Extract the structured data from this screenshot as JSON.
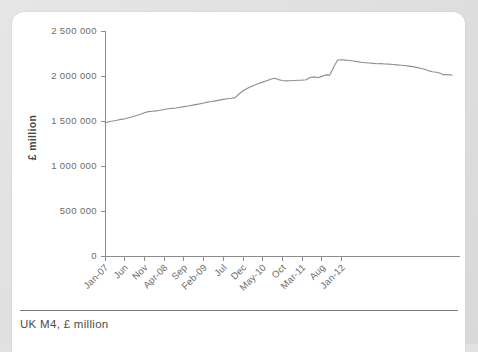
{
  "caption": {
    "text": "UK M4, £ million"
  },
  "chart_data": {
    "type": "line",
    "title": "",
    "subtitle": "",
    "xlabel": "",
    "ylabel": "£ million",
    "ylim": [
      0,
      2500000
    ],
    "xlim": [
      0,
      66
    ],
    "grid": false,
    "legend": "none",
    "y_ticks": [
      0,
      500000,
      1000000,
      1500000,
      2000000,
      2500000
    ],
    "y_tick_labels": [
      "0",
      "500 000",
      "1 000 000",
      "1 500 000",
      "2 000 000",
      "2 500 000"
    ],
    "x_tick_positions": [
      0,
      5,
      10,
      15,
      20,
      25,
      30,
      35,
      40,
      45,
      50,
      55,
      60
    ],
    "x_tick_labels": [
      "Jan-07",
      "Jun",
      "Nov",
      "Apr-08",
      "Sep",
      "Feb-09",
      "Jul",
      "Dec",
      "May-10",
      "Oct",
      "Mar-11",
      "Aug",
      "Jan-12"
    ],
    "line_color": "#8f8f8f",
    "axis_color": "#8d8d8d",
    "series": [
      {
        "name": "UK M4",
        "values": [
          1480000,
          1492000,
          1500000,
          1508000,
          1518000,
          1524000,
          1536000,
          1548000,
          1562000,
          1576000,
          1592000,
          1604000,
          1608000,
          1612000,
          1620000,
          1628000,
          1636000,
          1640000,
          1644000,
          1652000,
          1660000,
          1666000,
          1674000,
          1682000,
          1690000,
          1700000,
          1710000,
          1716000,
          1724000,
          1732000,
          1740000,
          1748000,
          1752000,
          1760000,
          1800000,
          1836000,
          1860000,
          1880000,
          1900000,
          1916000,
          1932000,
          1948000,
          1964000,
          1976000,
          1960000,
          1950000,
          1946000,
          1948000,
          1950000,
          1952000,
          1954000,
          1958000,
          1984000,
          1990000,
          1980000,
          1996000,
          2012000,
          2010000,
          2100000,
          2178000,
          2180000,
          2176000,
          2172000,
          2166000,
          2160000,
          2152000,
          2148000,
          2144000,
          2140000,
          2136000,
          2138000,
          2134000,
          2132000,
          2128000,
          2124000,
          2120000,
          2116000,
          2110000,
          2104000,
          2096000,
          2086000,
          2074000,
          2060000,
          2048000,
          2042000,
          2030000,
          2012000,
          2016000,
          2010000
        ]
      }
    ]
  }
}
